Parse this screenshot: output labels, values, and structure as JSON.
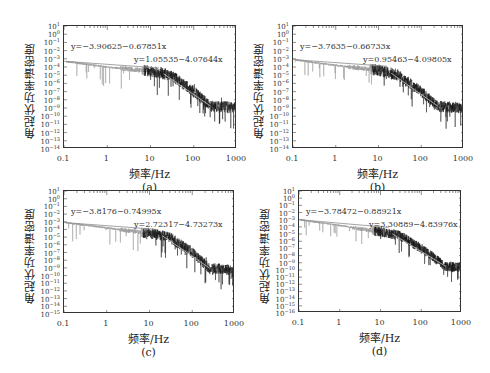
{
  "figure": {
    "panels": [
      {
        "id": "a",
        "caption": "(a)",
        "ylabel": "角起伏功率谱密度",
        "xlabel": "频率/Hz",
        "eq1": "y=−3.90625−0.67851x",
        "eq2": "y=1.05535−4.07644x",
        "frame": {
          "left": 63,
          "top": 25,
          "width": 173,
          "height": 123
        },
        "ymin_exp": -14,
        "ymax_exp": 1
      },
      {
        "id": "b",
        "caption": "(b)",
        "ylabel": "角起伏功率谱密度",
        "xlabel": "频率/Hz",
        "eq1": "y=−3.7635−0.66733x",
        "eq2": "y=0.95463−4.09805x",
        "frame": {
          "left": 292,
          "top": 25,
          "width": 171,
          "height": 123
        },
        "ymin_exp": -14,
        "ymax_exp": 1
      },
      {
        "id": "c",
        "caption": "(c)",
        "ylabel": "角起伏功率谱密度",
        "xlabel": "频率/Hz",
        "eq1": "y=−3.8176−0.74995x",
        "eq2": "y=2.72317−4.73273x",
        "frame": {
          "left": 63,
          "top": 190,
          "width": 171,
          "height": 123
        },
        "ymin_exp": -15,
        "ymax_exp": 1
      },
      {
        "id": "d",
        "caption": "(d)",
        "ylabel": "角起伏功率谱密度",
        "xlabel": "频率/Hz",
        "eq1": "y=−3.78472−0.88921x",
        "eq2": "y=3.30889−4.83976x",
        "frame": {
          "left": 298,
          "top": 190,
          "width": 163,
          "height": 122
        },
        "ymin_exp": -16,
        "ymax_exp": 1
      }
    ]
  },
  "chart_data": [
    {
      "type": "line",
      "title": "(a)",
      "xlabel": "频率/Hz",
      "ylabel": "角起伏功率谱密度",
      "xscale": "log",
      "yscale": "log",
      "xlim": [
        0.1,
        1000
      ],
      "ylim": [
        "1e-14",
        "1e1"
      ],
      "x_ticks": [
        "0.1",
        "1",
        "10",
        "100",
        "1000"
      ],
      "y_ticks": [
        "10^1",
        "10^0",
        "10^-1",
        "10^-2",
        "10^-3",
        "10^-4",
        "10^-5",
        "10^-6",
        "10^-7",
        "10^-8",
        "10^-9",
        "10^-10",
        "10^-11",
        "10^-12",
        "10^-13",
        "10^-14"
      ],
      "grid": false,
      "series": [
        {
          "name": "PSD (measured, noisy)",
          "x": [
            0.1,
            1,
            10,
            30,
            100,
            250,
            1000
          ],
          "log10_y": [
            -3.3,
            -4.0,
            -4.5,
            -5.0,
            -7.0,
            -8.8,
            -8.9
          ]
        },
        {
          "name": "fit low-freq",
          "equation": "y=-3.90625-0.67851x",
          "intercept": -3.90625,
          "slope": -0.67851
        },
        {
          "name": "fit high-freq",
          "equation": "y=1.05535-4.07644x",
          "intercept": 1.05535,
          "slope": -4.07644
        }
      ]
    },
    {
      "type": "line",
      "title": "(b)",
      "xlabel": "频率/Hz",
      "ylabel": "角起伏功率谱密度",
      "xscale": "log",
      "yscale": "log",
      "xlim": [
        0.1,
        1000
      ],
      "ylim": [
        "1e-14",
        "1e1"
      ],
      "x_ticks": [
        "0.1",
        "1",
        "10",
        "100",
        "1000"
      ],
      "y_ticks": [
        "10^1",
        "10^0",
        "10^-1",
        "10^-2",
        "10^-3",
        "10^-4",
        "10^-5",
        "10^-6",
        "10^-7",
        "10^-8",
        "10^-9",
        "10^-10",
        "10^-11",
        "10^-12",
        "10^-13",
        "10^-14"
      ],
      "grid": false,
      "series": [
        {
          "name": "PSD (measured, noisy)",
          "x": [
            0.1,
            1,
            10,
            30,
            100,
            250,
            1000
          ],
          "log10_y": [
            -3.1,
            -3.8,
            -4.4,
            -5.0,
            -7.0,
            -8.8,
            -9.0
          ]
        },
        {
          "name": "fit low-freq",
          "equation": "y=-3.7635-0.66733x",
          "intercept": -3.7635,
          "slope": -0.66733
        },
        {
          "name": "fit high-freq",
          "equation": "y=0.95463-4.09805x",
          "intercept": 0.95463,
          "slope": -4.09805
        }
      ]
    },
    {
      "type": "line",
      "title": "(c)",
      "xlabel": "频率/Hz",
      "ylabel": "角起伏功率谱密度",
      "xscale": "log",
      "yscale": "log",
      "xlim": [
        0.1,
        1000
      ],
      "ylim": [
        "1e-15",
        "1e1"
      ],
      "x_ticks": [
        "0.1",
        "1",
        "10",
        "100",
        "1000"
      ],
      "y_ticks": [
        "10^1",
        "10^0",
        "10^-1",
        "10^-2",
        "10^-3",
        "10^-4",
        "10^-5",
        "10^-6",
        "10^-7",
        "10^-8",
        "10^-9",
        "10^-10",
        "10^-11",
        "10^-12",
        "10^-13",
        "10^-14",
        "10^-15"
      ],
      "grid": false,
      "series": [
        {
          "name": "PSD (measured, noisy)",
          "x": [
            0.1,
            1,
            10,
            30,
            100,
            250,
            1000
          ],
          "log10_y": [
            -3.1,
            -3.8,
            -4.5,
            -5.0,
            -7.0,
            -9.0,
            -9.3
          ]
        },
        {
          "name": "fit low-freq",
          "equation": "y=-3.8176-0.74995x",
          "intercept": -3.8176,
          "slope": -0.74995
        },
        {
          "name": "fit high-freq",
          "equation": "y=2.72317-4.73273x",
          "intercept": 2.72317,
          "slope": -4.73273
        }
      ]
    },
    {
      "type": "line",
      "title": "(d)",
      "xlabel": "频率/Hz",
      "ylabel": "角起伏功率谱密度",
      "xscale": "log",
      "yscale": "log",
      "xlim": [
        0.1,
        1000
      ],
      "ylim": [
        "1e-16",
        "1e1"
      ],
      "x_ticks": [
        "0.1",
        "1",
        "10",
        "100",
        "1000"
      ],
      "y_ticks": [
        "10^1",
        "10^0",
        "10^-1",
        "10^-2",
        "10^-3",
        "10^-4",
        "10^-5",
        "10^-6",
        "10^-7",
        "10^-8",
        "10^-9",
        "10^-10",
        "10^-11",
        "10^-12",
        "10^-13",
        "10^-14",
        "10^-15",
        "10^-16"
      ],
      "grid": false,
      "series": [
        {
          "name": "PSD (measured, noisy)",
          "x": [
            0.1,
            1,
            10,
            30,
            100,
            400,
            1000
          ],
          "log10_y": [
            -3.0,
            -3.8,
            -4.7,
            -5.2,
            -7.0,
            -9.5,
            -9.7
          ]
        },
        {
          "name": "fit low-freq",
          "equation": "y=-3.78472-0.88921x",
          "intercept": -3.78472,
          "slope": -0.88921
        },
        {
          "name": "fit high-freq",
          "equation": "y=3.30889-4.83976x",
          "intercept": 3.30889,
          "slope": -4.83976
        }
      ]
    }
  ]
}
